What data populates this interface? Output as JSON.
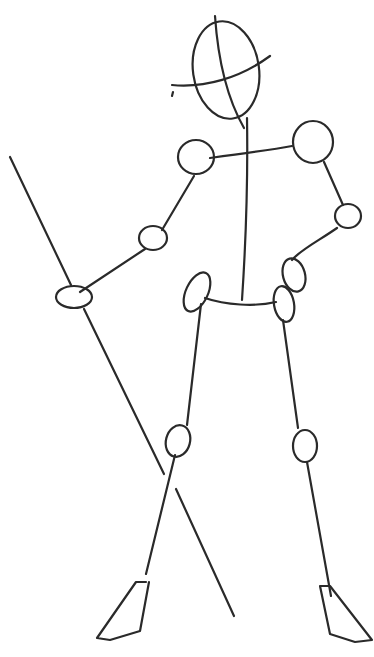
{
  "image": {
    "subject": "stick figure pose sketch holding a staff",
    "stroke_color": "#2a2a2a",
    "background": "#ffffff"
  }
}
